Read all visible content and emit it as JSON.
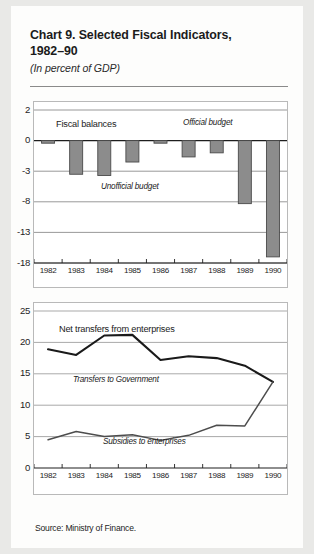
{
  "header": {
    "title": "Chart 9. Selected Fiscal Indicators, 1982–90",
    "title_line1": "Chart 9. Selected Fiscal Indicators,",
    "title_line2": "1982–90",
    "subtitle": "(In percent of GDP)"
  },
  "footer": {
    "source": "Source:  Ministry of Finance."
  },
  "chart_data": [
    {
      "type": "bar",
      "title": "Fiscal balances",
      "xlabel": "",
      "ylabel": "",
      "categories": [
        "1982",
        "1983",
        "1984",
        "1985",
        "1986",
        "1987",
        "1988",
        "1989",
        "1990"
      ],
      "values": [
        -0.2,
        -3.5,
        -3.7,
        -2.1,
        -0.2,
        -1.6,
        -1.2,
        -8.3,
        -17.0
      ],
      "ytick_labels": [
        "2",
        "0",
        "-3",
        "-8",
        "-13",
        "-18"
      ],
      "ytick_values": [
        2,
        0,
        -3,
        -8,
        -13,
        -18
      ],
      "yscale": "piecewise-even-spacing",
      "ylim": [
        -18,
        2
      ],
      "grid": true,
      "bar_color": "#8c8c8c",
      "bar_edge_color": "#4a4a4a",
      "annotations": [
        {
          "text": "Fiscal balances",
          "style": "upright"
        },
        {
          "text": "Official budget",
          "style": "italic"
        },
        {
          "text": "Unofficial budget",
          "style": "italic"
        }
      ]
    },
    {
      "type": "line",
      "title": "Net transfers from enterprises",
      "xlabel": "",
      "ylabel": "",
      "x": [
        "1982",
        "1983",
        "1984",
        "1985",
        "1986",
        "1987",
        "1988",
        "1989",
        "1990"
      ],
      "series": [
        {
          "name": "Transfers to Government",
          "values": [
            18.9,
            18.0,
            21.1,
            21.2,
            17.2,
            17.8,
            17.5,
            16.3,
            13.7
          ],
          "color": "#1a1a1a",
          "width": 2.1
        },
        {
          "name": "Subsidies to enterprises",
          "values": [
            4.5,
            5.8,
            5.0,
            5.3,
            4.4,
            5.2,
            6.8,
            6.7,
            13.7
          ],
          "color": "#4d4d4d",
          "width": 1.5
        }
      ],
      "ytick_labels": [
        "0",
        "5",
        "10",
        "15",
        "20",
        "25"
      ],
      "ytick_values": [
        0,
        5,
        10,
        15,
        20,
        25
      ],
      "ylim": [
        0,
        25
      ],
      "grid": true,
      "annotations": [
        {
          "text": "Net transfers from enterprises",
          "style": "upright"
        },
        {
          "text": "Transfers to Government",
          "style": "italic"
        },
        {
          "text": "Subsidies to enterprises",
          "style": "italic"
        }
      ]
    }
  ],
  "bar_axis": {
    "y_labels": [
      "2",
      "0",
      "-3",
      "-8",
      "-13",
      "-18"
    ],
    "x_labels": [
      "1982",
      "1983",
      "1984",
      "1985",
      "1986",
      "1987",
      "1988",
      "1989",
      "1990"
    ]
  },
  "line_axis": {
    "y_labels": [
      "0",
      "5",
      "10",
      "15",
      "20",
      "25"
    ],
    "x_labels": [
      "1982",
      "1983",
      "1984",
      "1985",
      "1986",
      "1987",
      "1988",
      "1989",
      "1990"
    ]
  },
  "bar_annotations": {
    "fiscal_balances": "Fiscal balances",
    "official_budget": "Official budget",
    "unofficial_budget": "Unofficial budget"
  },
  "line_annotations": {
    "net_transfers": "Net transfers from enterprises",
    "transfers_to_government": "Transfers to Government",
    "subsidies_to_enterprises": "Subsidies to enterprises"
  }
}
